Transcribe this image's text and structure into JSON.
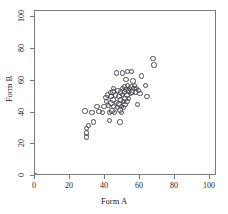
{
  "chart_data": {
    "type": "scatter",
    "title": "",
    "xlabel": "Form A",
    "ylabel": "Form B",
    "xlim": [
      0,
      104
    ],
    "ylim": [
      0,
      104
    ],
    "xticks": [
      0,
      20,
      40,
      60,
      80,
      100
    ],
    "yticks": [
      0,
      20,
      40,
      60,
      80,
      100
    ],
    "xticklabels": [
      "0",
      "20",
      "40",
      "60",
      "80",
      "100"
    ],
    "yticklabels": [
      "0",
      "20",
      "40",
      "60",
      "80",
      "100"
    ],
    "grid": false,
    "legend": null,
    "marker": "open-circle",
    "marker_color": "#4a4a55",
    "series": [
      {
        "name": "observations",
        "points": [
          [
            0,
            0
          ],
          [
            28.5,
            41
          ],
          [
            29.5,
            30
          ],
          [
            29.5,
            27
          ],
          [
            29.5,
            24.5
          ],
          [
            30.5,
            32
          ],
          [
            32.5,
            40
          ],
          [
            33.5,
            34
          ],
          [
            36.5,
            40.5
          ],
          [
            38.5,
            40
          ],
          [
            40.5,
            49.5
          ],
          [
            41,
            47
          ],
          [
            41.5,
            51
          ],
          [
            42,
            44.5
          ],
          [
            42.5,
            40
          ],
          [
            42.5,
            35
          ],
          [
            43,
            52.5
          ],
          [
            43.5,
            50
          ],
          [
            43.5,
            46
          ],
          [
            44,
            41
          ],
          [
            44.5,
            53
          ],
          [
            44.5,
            48
          ],
          [
            45,
            44
          ],
          [
            45.5,
            40
          ],
          [
            46,
            51
          ],
          [
            46.5,
            46.5
          ],
          [
            47,
            43
          ],
          [
            47.5,
            54
          ],
          [
            48,
            50
          ],
          [
            48,
            45.5
          ],
          [
            48.5,
            41.5
          ],
          [
            48.5,
            34
          ],
          [
            49,
            53
          ],
          [
            49,
            48
          ],
          [
            49.5,
            44
          ],
          [
            49.5,
            40
          ],
          [
            50,
            55
          ],
          [
            50,
            51.5
          ],
          [
            50.5,
            47
          ],
          [
            50.5,
            43
          ],
          [
            51,
            56
          ],
          [
            51,
            53
          ],
          [
            51.5,
            49
          ],
          [
            51.5,
            45
          ],
          [
            52,
            61
          ],
          [
            52,
            54.5
          ],
          [
            52.5,
            51
          ],
          [
            52.5,
            47
          ],
          [
            53,
            66
          ],
          [
            53,
            57
          ],
          [
            53.5,
            53.5
          ],
          [
            53.5,
            49
          ],
          [
            54,
            55
          ],
          [
            54.5,
            52
          ],
          [
            55,
            66
          ],
          [
            55,
            56
          ],
          [
            55.5,
            53
          ],
          [
            56,
            60
          ],
          [
            56.5,
            55
          ],
          [
            57,
            57
          ],
          [
            57.5,
            53
          ],
          [
            58,
            55
          ],
          [
            58.5,
            45
          ],
          [
            59,
            54
          ],
          [
            60,
            52
          ],
          [
            61,
            63
          ],
          [
            63,
            57
          ],
          [
            64,
            50
          ],
          [
            67.5,
            74
          ],
          [
            68,
            70
          ],
          [
            50,
            65
          ],
          [
            46.5,
            65
          ],
          [
            45,
            55
          ],
          [
            39.5,
            44
          ],
          [
            35.5,
            44
          ]
        ]
      }
    ]
  }
}
